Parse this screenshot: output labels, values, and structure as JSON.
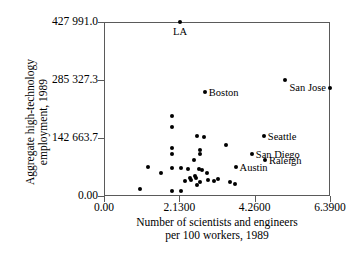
{
  "chart_data": {
    "type": "scatter",
    "title": "",
    "xlabel": "Number of scientists and engineers per 100 workers, 1989",
    "xlabel_line1": "Number of scientists and engineers",
    "xlabel_line2": "per 100 workers, 1989",
    "ylabel": "Aggregate high-technology employment, 1989",
    "ylabel_line1": "Aggregate high-technology",
    "ylabel_line2": "employment, 1989",
    "xlim": [
      0.0,
      6.39
    ],
    "ylim": [
      0.0,
      427991.0
    ],
    "xticks": [
      0.0,
      2.13,
      4.26,
      6.39
    ],
    "xticklabels": [
      "0.00",
      "2.1300",
      "4.2600",
      "6.3900"
    ],
    "yticks": [
      0.0,
      142663.7,
      285327.3,
      427991.0
    ],
    "yticklabels": [
      "0.00",
      "142 663.7",
      "285 327.3",
      "427 991.0"
    ],
    "grid": false,
    "legend": "none",
    "marker": "filled-circle",
    "marker_color": "#000000",
    "points": [
      {
        "x": 2.15,
        "y": 427991.0,
        "label": "LA",
        "label_pos": "below"
      },
      {
        "x": 5.12,
        "y": 285327.3,
        "label": "",
        "label_pos": ""
      },
      {
        "x": 6.39,
        "y": 266000.0,
        "label": "San Jose",
        "label_pos": "left"
      },
      {
        "x": 2.85,
        "y": 255000.0,
        "label": "Boston",
        "label_pos": "right"
      },
      {
        "x": 4.52,
        "y": 147000.0,
        "label": "Seattle",
        "label_pos": "right"
      },
      {
        "x": 4.18,
        "y": 103000.0,
        "label": "San Diego",
        "label_pos": "right"
      },
      {
        "x": 4.55,
        "y": 88000.0,
        "label": "Raleigh",
        "label_pos": "right"
      },
      {
        "x": 3.72,
        "y": 72000.0,
        "label": "Austin",
        "label_pos": "right"
      },
      {
        "x": 1.93,
        "y": 196000.0,
        "label": "",
        "label_pos": ""
      },
      {
        "x": 1.93,
        "y": 170000.0,
        "label": "",
        "label_pos": ""
      },
      {
        "x": 1.93,
        "y": 118000.0,
        "label": "",
        "label_pos": ""
      },
      {
        "x": 1.93,
        "y": 104000.0,
        "label": "",
        "label_pos": ""
      },
      {
        "x": 1.93,
        "y": 70000.0,
        "label": "",
        "label_pos": ""
      },
      {
        "x": 1.93,
        "y": 13000.0,
        "label": "",
        "label_pos": ""
      },
      {
        "x": 2.62,
        "y": 148000.0,
        "label": "",
        "label_pos": ""
      },
      {
        "x": 2.83,
        "y": 145000.0,
        "label": "",
        "label_pos": ""
      },
      {
        "x": 2.72,
        "y": 112000.0,
        "label": "",
        "label_pos": ""
      },
      {
        "x": 2.72,
        "y": 104000.0,
        "label": "",
        "label_pos": ""
      },
      {
        "x": 3.46,
        "y": 125000.0,
        "label": "",
        "label_pos": ""
      },
      {
        "x": 2.55,
        "y": 88000.0,
        "label": "",
        "label_pos": ""
      },
      {
        "x": 2.7,
        "y": 66000.0,
        "label": "",
        "label_pos": ""
      },
      {
        "x": 2.78,
        "y": 64000.0,
        "label": "",
        "label_pos": ""
      },
      {
        "x": 2.18,
        "y": 70000.0,
        "label": "",
        "label_pos": ""
      },
      {
        "x": 2.38,
        "y": 67000.0,
        "label": "",
        "label_pos": ""
      },
      {
        "x": 1.25,
        "y": 72000.0,
        "label": "",
        "label_pos": ""
      },
      {
        "x": 1.62,
        "y": 57000.0,
        "label": "",
        "label_pos": ""
      },
      {
        "x": 2.42,
        "y": 45000.0,
        "label": "",
        "label_pos": ""
      },
      {
        "x": 2.46,
        "y": 40000.0,
        "label": "",
        "label_pos": ""
      },
      {
        "x": 2.56,
        "y": 48000.0,
        "label": "",
        "label_pos": ""
      },
      {
        "x": 2.6,
        "y": 44000.0,
        "label": "",
        "label_pos": ""
      },
      {
        "x": 2.9,
        "y": 56000.0,
        "label": "",
        "label_pos": ""
      },
      {
        "x": 2.95,
        "y": 40000.0,
        "label": "",
        "label_pos": ""
      },
      {
        "x": 3.1,
        "y": 38000.0,
        "label": "",
        "label_pos": ""
      },
      {
        "x": 2.3,
        "y": 38000.0,
        "label": "",
        "label_pos": ""
      },
      {
        "x": 2.72,
        "y": 34000.0,
        "label": "",
        "label_pos": ""
      },
      {
        "x": 3.22,
        "y": 41000.0,
        "label": "",
        "label_pos": ""
      },
      {
        "x": 3.55,
        "y": 34000.0,
        "label": "",
        "label_pos": ""
      },
      {
        "x": 1.03,
        "y": 17000.0,
        "label": "",
        "label_pos": ""
      },
      {
        "x": 2.18,
        "y": 13000.0,
        "label": "",
        "label_pos": ""
      },
      {
        "x": 2.62,
        "y": 28000.0,
        "label": "",
        "label_pos": ""
      },
      {
        "x": 3.7,
        "y": 30000.0,
        "label": "",
        "label_pos": ""
      }
    ]
  }
}
